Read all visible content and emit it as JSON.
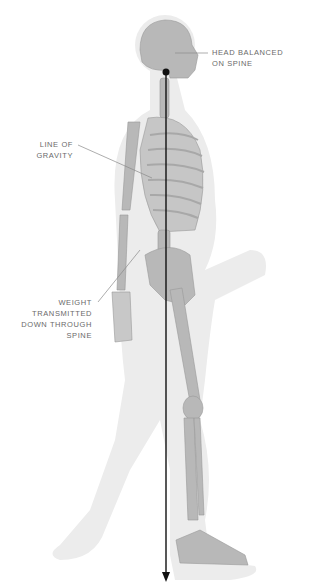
{
  "diagram": {
    "labels": {
      "head": {
        "line1": "HEAD BALANCED",
        "line2": "ON SPINE"
      },
      "gravity": {
        "line1": "LINE OF",
        "line2": "GRAVITY"
      },
      "weight": {
        "line1": "WEIGHT",
        "line2": "TRANSMITTED",
        "line3": "DOWN THROUGH",
        "line4": "SPINE"
      }
    },
    "colors": {
      "silhouette": "#ececec",
      "bone": "#b4b4b4",
      "bone_dark": "#9a9a9a",
      "gravity_line": "#111111",
      "leader_line": "#8a8a8a",
      "label_text": "#6a6a6a"
    }
  }
}
